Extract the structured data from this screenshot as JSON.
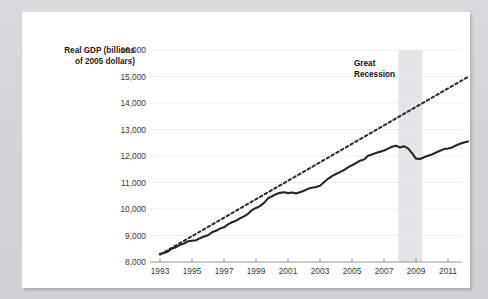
{
  "figure": {
    "background_color": "#d5d7d8",
    "card_color": "#ffffff"
  },
  "chart_data": {
    "type": "line",
    "title": "",
    "xlabel": "",
    "ylabel": "Real GDP (billions of 2005 dollars)",
    "ylabel_line1": "Real GDP (billions",
    "ylabel_line2": "of 2005 dollars)",
    "ylim": [
      8000,
      16000
    ],
    "xlim": [
      1993,
      2012.5
    ],
    "grid": true,
    "grid_axis": "y",
    "legend_position": "none",
    "ytick_labels": [
      "16,000",
      "15,000",
      "14,000",
      "13,000",
      "12,000",
      "11,000",
      "10,000",
      "9,000",
      "8,000"
    ],
    "ytick_values": [
      16000,
      15000,
      14000,
      13000,
      12000,
      11000,
      10000,
      9000,
      8000
    ],
    "xtick_labels": [
      "1993",
      "1995",
      "1997",
      "1999",
      "2001",
      "2003",
      "2005",
      "2007",
      "2009",
      "2011"
    ],
    "xtick_values": [
      1993,
      1995,
      1997,
      1999,
      2001,
      2003,
      2005,
      2007,
      2009,
      2011
    ],
    "annotations": [
      {
        "name": "great-recession-label",
        "text": "Great Recession",
        "line1": "Great",
        "line2": "Recession",
        "x": 2006.6,
        "y": 15100
      },
      {
        "name": "recession-band",
        "type": "vspan",
        "label": "Great Recession",
        "x_start": 2007.9,
        "x_end": 2009.4,
        "color": "#e4e5e6"
      }
    ],
    "series": [
      {
        "name": "Real GDP (actual)",
        "style": "solid",
        "color": "#262626",
        "x": [
          1993.0,
          1993.25,
          1993.5,
          1993.75,
          1994.0,
          1994.25,
          1994.5,
          1994.75,
          1995.0,
          1995.25,
          1995.5,
          1995.75,
          1996.0,
          1996.25,
          1996.5,
          1996.75,
          1997.0,
          1997.25,
          1997.5,
          1997.75,
          1998.0,
          1998.25,
          1998.5,
          1998.75,
          1999.0,
          1999.25,
          1999.5,
          1999.75,
          2000.0,
          2000.25,
          2000.5,
          2000.75,
          2001.0,
          2001.25,
          2001.5,
          2001.75,
          2002.0,
          2002.25,
          2002.5,
          2002.75,
          2003.0,
          2003.25,
          2003.5,
          2003.75,
          2004.0,
          2004.25,
          2004.5,
          2004.75,
          2005.0,
          2005.25,
          2005.5,
          2005.75,
          2006.0,
          2006.25,
          2006.5,
          2006.75,
          2007.0,
          2007.25,
          2007.5,
          2007.75,
          2008.0,
          2008.25,
          2008.5,
          2008.75,
          2009.0,
          2009.25,
          2009.5,
          2009.75,
          2010.0,
          2010.25,
          2010.5,
          2010.75,
          2011.0,
          2011.25,
          2011.5,
          2011.75,
          2012.0,
          2012.25
        ],
        "y": [
          8310,
          8340,
          8400,
          8510,
          8560,
          8650,
          8700,
          8780,
          8800,
          8820,
          8900,
          8960,
          9010,
          9120,
          9180,
          9260,
          9310,
          9420,
          9500,
          9560,
          9650,
          9720,
          9820,
          9960,
          10040,
          10110,
          10230,
          10400,
          10480,
          10560,
          10610,
          10630,
          10600,
          10620,
          10590,
          10630,
          10690,
          10760,
          10800,
          10830,
          10880,
          11010,
          11140,
          11240,
          11320,
          11390,
          11470,
          11570,
          11650,
          11730,
          11820,
          11870,
          12010,
          12060,
          12110,
          12160,
          12210,
          12280,
          12350,
          12390,
          12320,
          12370,
          12290,
          12110,
          11900,
          11890,
          11950,
          12010,
          12060,
          12130,
          12200,
          12260,
          12280,
          12320,
          12400,
          12460,
          12510,
          12550
        ],
        "y_display_scale": "billions of 2005 dollars"
      },
      {
        "name": "Potential GDP (trend)",
        "style": "dotted",
        "color": "#2b2b2b",
        "x": [
          1993.0,
          2012.3
        ],
        "y": [
          8280,
          15000
        ],
        "description": "straight dotted trend line from about 8,300 in 1993 to about 15,000 in 2012"
      }
    ]
  }
}
